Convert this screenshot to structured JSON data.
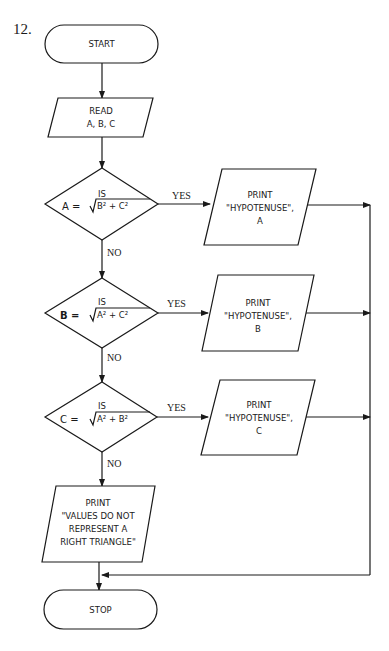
{
  "problem_number": "12.",
  "nodes": {
    "start": {
      "type": "terminal",
      "label": "START"
    },
    "read": {
      "type": "io",
      "lines": [
        "READ",
        "A, B, C"
      ]
    },
    "decision_a": {
      "type": "decision",
      "top": "IS",
      "lhs": "A =",
      "radical": "B² + C²"
    },
    "print_a": {
      "type": "io",
      "lines": [
        "PRINT",
        "\"HYPOTENUSE\",",
        "A"
      ]
    },
    "decision_b": {
      "type": "decision",
      "top": "IS",
      "lhs": "B =",
      "radical": "A² + C²"
    },
    "print_b": {
      "type": "io",
      "lines": [
        "PRINT",
        "\"HYPOTENUSE\",",
        "B"
      ]
    },
    "decision_c": {
      "type": "decision",
      "top": "IS",
      "lhs": "C =",
      "radical": "A² + B²"
    },
    "print_c": {
      "type": "io",
      "lines": [
        "PRINT",
        "\"HYPOTENUSE\",",
        "C"
      ]
    },
    "print_none": {
      "type": "io",
      "lines": [
        "PRINT",
        "\"VALUES DO NOT",
        "REPRESENT A",
        "RIGHT TRIANGLE\""
      ]
    },
    "stop": {
      "type": "terminal",
      "label": "STOP"
    }
  },
  "edge_labels": {
    "yes": "YES",
    "no": "NO"
  },
  "edges": [
    {
      "from": "start",
      "to": "read"
    },
    {
      "from": "read",
      "to": "decision_a"
    },
    {
      "from": "decision_a",
      "to": "print_a",
      "label": "YES"
    },
    {
      "from": "decision_a",
      "to": "decision_b",
      "label": "NO"
    },
    {
      "from": "decision_b",
      "to": "print_b",
      "label": "YES"
    },
    {
      "from": "decision_b",
      "to": "decision_c",
      "label": "NO"
    },
    {
      "from": "decision_c",
      "to": "print_c",
      "label": "YES"
    },
    {
      "from": "decision_c",
      "to": "print_none",
      "label": "NO"
    },
    {
      "from": "print_a",
      "to": "stop"
    },
    {
      "from": "print_b",
      "to": "stop"
    },
    {
      "from": "print_c",
      "to": "stop"
    },
    {
      "from": "print_none",
      "to": "stop"
    }
  ]
}
